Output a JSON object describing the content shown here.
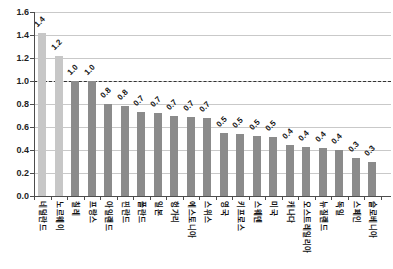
{
  "chart_data": {
    "type": "bar",
    "title": "",
    "xlabel": "",
    "ylabel": "",
    "categories": [
      "네덜란드",
      "노르웨이",
      "칠레",
      "프랑스",
      "아일랜드",
      "핀란드",
      "폴란드",
      "일본",
      "헝가리",
      "에스토니아",
      "스위스",
      "영국",
      "키프로스",
      "스웨덴",
      "미국",
      "캐나다",
      "오스트레일리아",
      "뉴질랜드",
      "독일",
      "스페인",
      "슬로베니아"
    ],
    "values": [
      1.4,
      1.2,
      1.0,
      1.0,
      0.8,
      0.8,
      0.7,
      0.7,
      0.7,
      0.7,
      0.7,
      0.5,
      0.5,
      0.5,
      0.5,
      0.4,
      0.4,
      0.4,
      0.4,
      0.3,
      0.3
    ],
    "value_labels": [
      "1.4",
      "1.2",
      "1.0",
      "1.0",
      "0.8",
      "0.8",
      "0.7",
      "0.7",
      "0.7",
      "0.7",
      "0.7",
      "0.5",
      "0.5",
      "0.5",
      "0.5",
      "0.4",
      "0.4",
      "0.4",
      "0.4",
      "0.3",
      "0.3"
    ],
    "bar_heights": [
      1.42,
      1.22,
      1.0,
      1.0,
      0.8,
      0.78,
      0.73,
      0.72,
      0.7,
      0.69,
      0.68,
      0.55,
      0.54,
      0.52,
      0.51,
      0.44,
      0.43,
      0.42,
      0.4,
      0.33,
      0.3
    ],
    "ylim": [
      0,
      1.6
    ],
    "yticks": [
      "0.0",
      "0.2",
      "0.4",
      "0.6",
      "0.8",
      "1.0",
      "1.2",
      "1.4",
      "1.6"
    ],
    "ytick_step": 0.2,
    "grid": true,
    "legend": "none",
    "reference_line": {
      "value": 1.0,
      "style": "dashed",
      "color": "#333333"
    },
    "colors": {
      "bar_highlight": "#c7c7c7",
      "bar_default": "#8b8b8b",
      "highlight_count": 2,
      "gridline": "#c9c9c9",
      "axis": "#4d4d4d",
      "label_text": "#111111",
      "background": "#ffffff"
    }
  }
}
